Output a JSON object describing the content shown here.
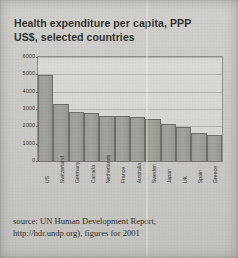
{
  "figure": {
    "title_line1": "Health expenditure per capita, PPP",
    "title_line2": "US$, selected countries",
    "source_line1": "source: UN Human Development Report,",
    "source_line2": "http://hdr.undp.org), figures for 2001",
    "colors": {
      "paper": "#cdccc8",
      "bar_fill": "#9c9c97",
      "bar_stroke": "#6e6e68",
      "gridline": "#a9a9a3",
      "frame": "#8d8d88",
      "text": "#2f2f2d"
    }
  },
  "chart_data": {
    "type": "bar",
    "title": "Health expenditure per capita, PPP US$, selected countries",
    "xlabel": "",
    "ylabel": "",
    "ylim": [
      0,
      6000
    ],
    "yticks": [
      6000,
      5000,
      4000,
      3000,
      2000,
      1000,
      0
    ],
    "ytick_labels": [
      "6000",
      "5000",
      "4000",
      "3000",
      "2000",
      "1000",
      "0"
    ],
    "grid": true,
    "legend": false,
    "categories": [
      "US",
      "Switzerland",
      "Germany",
      "Canada",
      "Netherlands",
      "France",
      "Australia",
      "Sweden",
      "Japan",
      "UK",
      "Spain",
      "Greece"
    ],
    "values": [
      4990,
      3300,
      2800,
      2790,
      2620,
      2570,
      2530,
      2420,
      2130,
      1990,
      1600,
      1520
    ],
    "source": "UN Human Development Report, http://hdr.undp.org, figures for 2001"
  }
}
